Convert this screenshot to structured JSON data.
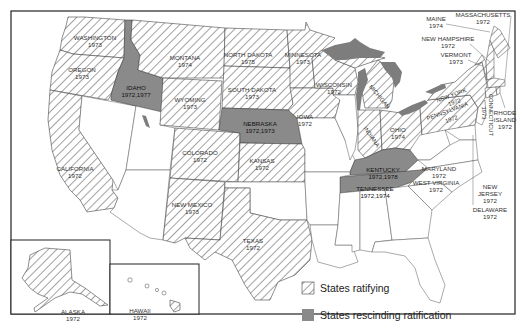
{
  "map": {
    "title": "Equal Rights Amendment ratification by state",
    "colors": {
      "ratified_hatch": "#555555",
      "rescinded_fill": "#8a8a8a",
      "lakes_fill": "#7d7d7d",
      "border": "#333333",
      "background": "#ffffff"
    },
    "legend": {
      "ratifying_label": "States ratifying",
      "rescinding_label": "States rescinding ratification"
    },
    "states": {
      "washington": {
        "name": "WASHINGTON",
        "year": "1973",
        "status": "ratified"
      },
      "oregon": {
        "name": "OREGON",
        "year": "1973",
        "status": "ratified"
      },
      "idaho": {
        "name": "IDAHO",
        "year": "1972,1977",
        "status": "rescinded"
      },
      "montana": {
        "name": "MONTANA",
        "year": "1974",
        "status": "ratified"
      },
      "wyoming": {
        "name": "WYOMING",
        "year": "1973",
        "status": "ratified"
      },
      "north_dakota": {
        "name": "NORTH DAKOTA",
        "year": "1975",
        "status": "ratified"
      },
      "south_dakota": {
        "name": "SOUTH DAKOTA",
        "year": "1973",
        "status": "ratified"
      },
      "nebraska": {
        "name": "NEBRASKA",
        "year": "1972,1973",
        "status": "rescinded"
      },
      "minnesota": {
        "name": "MINNESOTA",
        "year": "1973",
        "status": "ratified"
      },
      "iowa": {
        "name": "IOWA",
        "year": "1972",
        "status": "ratified"
      },
      "wisconsin": {
        "name": "WISCONSIN",
        "year": "1972",
        "status": "ratified"
      },
      "michigan": {
        "name": "MICHIGAN",
        "year": "1972",
        "status": "ratified"
      },
      "indiana": {
        "name": "INDIANA",
        "year": "1977",
        "status": "ratified"
      },
      "ohio": {
        "name": "OHIO",
        "year": "1974",
        "status": "ratified"
      },
      "kentucky": {
        "name": "KENTUCKY",
        "year": "1972,1978",
        "status": "rescinded"
      },
      "tennessee": {
        "name": "TENNESSEE",
        "year": "1972,1974",
        "status": "rescinded"
      },
      "california": {
        "name": "CALIFORNIA",
        "year": "1972",
        "status": "ratified"
      },
      "colorado": {
        "name": "COLORADO",
        "year": "1972",
        "status": "ratified"
      },
      "kansas": {
        "name": "KANSAS",
        "year": "1972",
        "status": "ratified"
      },
      "new_mexico": {
        "name": "NEW MEXICO",
        "year": "1973",
        "status": "ratified"
      },
      "texas": {
        "name": "TEXAS",
        "year": "1972",
        "status": "ratified"
      },
      "pennsylvania": {
        "name": "PENNSYLVANIA",
        "year": "1972",
        "status": "ratified"
      },
      "new_york": {
        "name": "NEW YORK",
        "year": "1972",
        "status": "ratified"
      },
      "maine": {
        "name": "MAINE",
        "year": "1974",
        "status": "ratified"
      },
      "massachusetts": {
        "name": "MASSACHUSETTS",
        "year": "1972",
        "status": "ratified"
      },
      "new_hampshire": {
        "name": "NEW HAMPSHIRE",
        "year": "1972",
        "status": "ratified"
      },
      "vermont": {
        "name": "VERMONT",
        "year": "1973",
        "status": "ratified"
      },
      "rhode_island": {
        "name1": "RHODE",
        "name2": "ISLAND",
        "year": "1972",
        "status": "ratified"
      },
      "connecticut": {
        "name": "CONNECTICUT",
        "year": "1973",
        "status": "ratified"
      },
      "maryland": {
        "name": "MARYLAND",
        "year": "1972",
        "status": "ratified"
      },
      "west_virginia": {
        "name": "WEST VIRGINIA",
        "year": "1972",
        "status": "ratified"
      },
      "new_jersey": {
        "name1": "NEW",
        "name2": "JERSEY",
        "year": "1972",
        "status": "ratified"
      },
      "delaware": {
        "name": "DELAWARE",
        "year": "1972",
        "status": "ratified"
      },
      "alaska": {
        "name": "ALASKA",
        "year": "1972",
        "status": "ratified"
      },
      "hawaii": {
        "name": "HAWAII",
        "year": "1972",
        "status": "ratified"
      }
    }
  }
}
